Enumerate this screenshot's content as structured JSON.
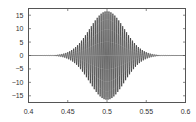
{
  "chart_data": {
    "type": "line",
    "title": "",
    "xlabel": "",
    "ylabel": "",
    "xlim": [
      0.4,
      0.6
    ],
    "ylim": [
      -17.5,
      17.5
    ],
    "grid": false,
    "legend": null,
    "x_ticks": [
      "0.4",
      "0.45",
      "0.5",
      "0.55",
      "0.6"
    ],
    "y_ticks": [
      "15",
      "10",
      "5",
      "0",
      "-5",
      "-10",
      "-15"
    ],
    "series": [
      {
        "name": "signal",
        "color": "#111111",
        "envelope": {
          "center": 0.5,
          "amplitude": 16.5,
          "sigma": 0.022,
          "x_sample": [
            0.4,
            0.42,
            0.44,
            0.46,
            0.48,
            0.49,
            0.5,
            0.51,
            0.52,
            0.54,
            0.56,
            0.58,
            0.6
          ],
          "y_upper": [
            0.0,
            0.1,
            0.4,
            3.2,
            10.8,
            14.8,
            16.5,
            14.8,
            10.8,
            3.2,
            0.4,
            0.1,
            0.0
          ]
        }
      }
    ]
  },
  "axes": {
    "x_tick_labels": [
      "0.4",
      "0.45",
      "0.5",
      "0.55",
      "0.6"
    ],
    "y_tick_labels": [
      "15",
      "10",
      "5",
      "0",
      "-5",
      "-10",
      "-15"
    ]
  }
}
